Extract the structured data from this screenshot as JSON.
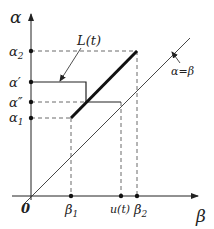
{
  "axes": {
    "y_label": "α",
    "x_label": "β",
    "origin_label": "0"
  },
  "y_ticks": [
    {
      "id": "alpha2",
      "label": "α",
      "sub": "2"
    },
    {
      "id": "alpha_prime",
      "label": "α′",
      "sub": ""
    },
    {
      "id": "alpha_dprime",
      "label": "α″",
      "sub": ""
    },
    {
      "id": "alpha1",
      "label": "α",
      "sub": "1"
    }
  ],
  "x_ticks": [
    {
      "id": "beta1",
      "label": "β",
      "sub": "1"
    },
    {
      "id": "u_t",
      "label": "u(t)",
      "sub": ""
    },
    {
      "id": "beta2",
      "label": "β",
      "sub": "2"
    }
  ],
  "annotations": {
    "curve_label": "L(t)",
    "diagonal_label": "α=β"
  },
  "colors": {
    "line": "#222222",
    "dashed": "#444444",
    "background": "#ffffff"
  }
}
